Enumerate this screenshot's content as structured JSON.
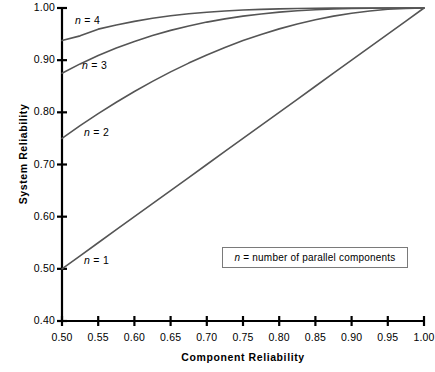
{
  "chart_data": {
    "type": "line",
    "title": "",
    "xlabel": "Component Reliability",
    "ylabel": "System Reliability",
    "xlim": [
      0.5,
      1.0
    ],
    "ylim": [
      0.4,
      1.0
    ],
    "grid": false,
    "legend_position": "inside-lower-right",
    "legend_note": "n = number of parallel components",
    "legend_note_symbol": "n",
    "legend_note_rest": " = number of parallel components",
    "xticks": [
      "0.50",
      "0.55",
      "0.60",
      "0.65",
      "0.70",
      "0.75",
      "0.80",
      "0.85",
      "0.90",
      "0.95",
      "1.00"
    ],
    "xtick_values": [
      0.5,
      0.55,
      0.6,
      0.65,
      0.7,
      0.75,
      0.8,
      0.85,
      0.9,
      0.95,
      1.0
    ],
    "yticks": [
      "0.40",
      "0.50",
      "0.60",
      "0.70",
      "0.80",
      "0.90",
      "1.00"
    ],
    "ytick_values": [
      0.4,
      0.5,
      0.6,
      0.7,
      0.8,
      0.9,
      1.0
    ],
    "formula": "R = 1 - (1 - p)^n",
    "x": [
      0.5,
      0.525,
      0.55,
      0.575,
      0.6,
      0.625,
      0.65,
      0.675,
      0.7,
      0.725,
      0.75,
      0.775,
      0.8,
      0.825,
      0.85,
      0.875,
      0.9,
      0.925,
      0.95,
      0.975,
      1.0
    ],
    "series": [
      {
        "name": "n = 1",
        "n": 1,
        "label_symbol": "n",
        "label_rest": " = 1",
        "values": [
          0.5,
          0.525,
          0.55,
          0.575,
          0.6,
          0.625,
          0.65,
          0.675,
          0.7,
          0.725,
          0.75,
          0.775,
          0.8,
          0.825,
          0.85,
          0.875,
          0.9,
          0.925,
          0.95,
          0.975,
          1.0
        ]
      },
      {
        "name": "n = 2",
        "n": 2,
        "label_symbol": "n",
        "label_rest": " = 2",
        "values": [
          0.75,
          0.774375,
          0.7975,
          0.819375,
          0.84,
          0.859375,
          0.8775,
          0.894375,
          0.91,
          0.924375,
          0.9375,
          0.949375,
          0.96,
          0.969375,
          0.9775,
          0.984375,
          0.99,
          0.994375,
          0.9975,
          0.999375,
          1.0
        ]
      },
      {
        "name": "n = 3",
        "n": 3,
        "label_symbol": "n",
        "label_rest": " = 3",
        "values": [
          0.875,
          0.892828,
          0.908875,
          0.923234,
          0.936,
          0.947266,
          0.957125,
          0.965672,
          0.973,
          0.979203,
          0.984375,
          0.988609,
          0.992,
          0.994641,
          0.996625,
          0.998047,
          0.999,
          0.999578,
          0.999875,
          0.999984,
          1.0
        ]
      },
      {
        "name": "n = 4",
        "n": 4,
        "label_symbol": "n",
        "label_rest": " = 4",
        "values": [
          0.9375,
          0.946593,
          0.959494,
          0.967362,
          0.9744,
          0.980225,
          0.985006,
          0.988906,
          0.9919,
          0.994281,
          0.996094,
          0.997445,
          0.9984,
          0.999062,
          0.999494,
          0.999756,
          0.9999,
          0.999968,
          0.999994,
          0.999999,
          1.0
        ]
      }
    ],
    "curve_labels": [
      {
        "text": "n = 4",
        "symbol": "n",
        "rest": " = 4",
        "left": 75,
        "top": 14
      },
      {
        "text": "n = 3",
        "symbol": "n",
        "rest": " = 3",
        "left": 82,
        "top": 59
      },
      {
        "text": "n = 2",
        "symbol": "n",
        "rest": " = 2",
        "left": 84,
        "top": 126
      },
      {
        "text": "n = 1",
        "symbol": "n",
        "rest": " = 1",
        "left": 84,
        "top": 254
      }
    ],
    "axis_color": "#000000",
    "line_color": "#555555"
  }
}
